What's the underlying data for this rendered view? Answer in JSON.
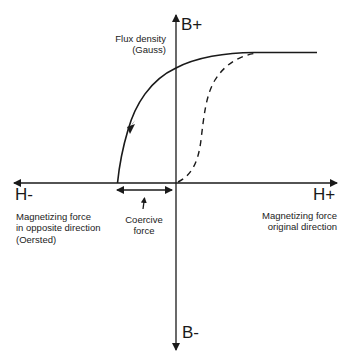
{
  "diagram": {
    "axes": {
      "y_positive_label": "B+",
      "y_negative_label": "B-",
      "x_positive_label": "H+",
      "x_negative_label": "H-",
      "y_axis_caption": [
        "Flux density",
        "(Gauss)"
      ],
      "x_positive_caption": [
        "Magnetizing force",
        "original direction"
      ],
      "x_negative_caption": [
        "Magnetizing force",
        "in opposite direction",
        "(Oersted)"
      ]
    },
    "annotations": {
      "coercive_force": [
        "Coercive",
        "force"
      ]
    },
    "curves": [
      {
        "name": "initial-magnetization",
        "style": "dashed",
        "description": "S-shaped curve from origin to saturation"
      },
      {
        "name": "demagnetization",
        "style": "solid",
        "description": "From saturation through remanence to coercive point, arrow pointing down-left"
      }
    ],
    "colors": {
      "line": "#1a1a1a",
      "background": "#ffffff"
    }
  }
}
